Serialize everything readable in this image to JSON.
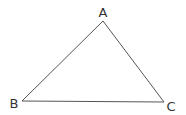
{
  "diagram": {
    "type": "triangle",
    "vertices": [
      {
        "label": "A",
        "x": 103,
        "y": 21,
        "label_x": 103,
        "label_y": 17
      },
      {
        "label": "B",
        "x": 22,
        "y": 101,
        "label_x": 14,
        "label_y": 108
      },
      {
        "label": "C",
        "x": 164,
        "y": 102,
        "label_x": 171,
        "label_y": 111
      }
    ],
    "edges": [
      [
        "A",
        "B"
      ],
      [
        "B",
        "C"
      ],
      [
        "C",
        "A"
      ]
    ],
    "colors": {
      "line": "#555555",
      "text": "#333333",
      "background": "#ffffff"
    }
  }
}
